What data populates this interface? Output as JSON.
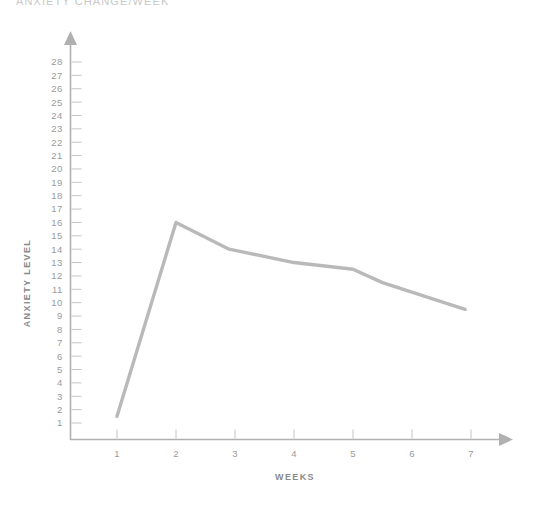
{
  "chart_title": "ANXIETY CHANGE/WEEK",
  "axis": {
    "y_title": "ANXIETY LEVEL",
    "x_title": "WEEKS"
  },
  "colors": {
    "line": "#b9b9b9",
    "axis": "#b0b0b0",
    "tick": "#c4c4c4",
    "label": "#9a9a9a",
    "title": "#c9c9c9",
    "background": "#ffffff"
  },
  "chart_data": {
    "type": "line",
    "title": "ANXIETY CHANGE/WEEK",
    "xlabel": "WEEKS",
    "ylabel": "ANXIETY LEVEL",
    "xlim": [
      1,
      7
    ],
    "ylim": [
      1,
      28
    ],
    "grid": false,
    "legend": "none",
    "x_ticks": [
      1,
      2,
      3,
      4,
      5,
      6,
      7
    ],
    "y_ticks": [
      1,
      2,
      3,
      4,
      5,
      6,
      7,
      8,
      9,
      10,
      11,
      12,
      13,
      14,
      15,
      16,
      17,
      18,
      19,
      20,
      21,
      22,
      23,
      24,
      25,
      26,
      27,
      28
    ],
    "series": [
      {
        "name": "Anxiety level",
        "x": [
          1.0,
          2.0,
          2.9,
          4.0,
          5.0,
          5.5,
          6.9
        ],
        "values": [
          1.5,
          16.0,
          14.0,
          13.0,
          12.5,
          11.5,
          9.5
        ]
      }
    ]
  }
}
